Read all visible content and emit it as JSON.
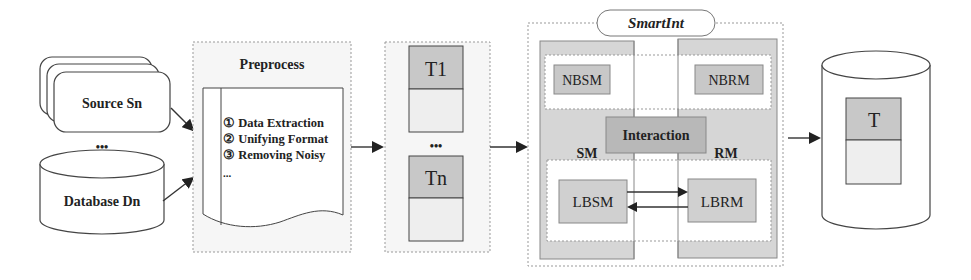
{
  "sources": {
    "source_label": "Source Sn",
    "ellipsis": "•••",
    "database_label": "Database Dn"
  },
  "preprocess": {
    "title": "Preprocess",
    "steps": [
      "① Data Extraction",
      "② Unifying Format",
      "③ Removing Noisy"
    ],
    "more": "..."
  },
  "tables": {
    "first": "T1",
    "ellipsis": "•••",
    "last": "Tn"
  },
  "smartint": {
    "title": "SmartInt",
    "nbsm": "NBSM",
    "nbrm": "NBRM",
    "interaction": "Interaction",
    "sm": "SM",
    "rm": "RM",
    "lbsm": "LBSM",
    "lbrm": "LBRM"
  },
  "output": {
    "table": "T"
  },
  "colors": {
    "dark_fill": "#c8c8c8",
    "light_fill": "#eeeeee",
    "panel_fill": "#f6f6f6",
    "stroke": "#444444"
  }
}
